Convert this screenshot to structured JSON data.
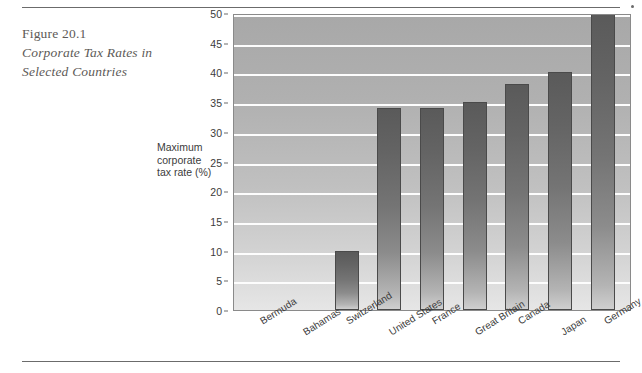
{
  "figure": {
    "number": "Figure 20.1",
    "title_line1": "Corporate Tax Rates in",
    "title_line2": "Selected Countries"
  },
  "axis": {
    "y_label_line1": "Maximum",
    "y_label_line2": "corporate",
    "y_label_line3": "tax rate (%)",
    "y_ticks": [
      "50",
      "45",
      "40",
      "35",
      "30",
      "25",
      "20",
      "15",
      "10",
      "5",
      "0"
    ]
  },
  "chart_data": {
    "type": "bar",
    "title": "Corporate Tax Rates in Selected Countries",
    "xlabel": "",
    "ylabel": "Maximum corporate tax rate (%)",
    "ylim": [
      0,
      50
    ],
    "ytick_step": 5,
    "grid": true,
    "legend": null,
    "categories": [
      "Bermuda",
      "Bahamas",
      "Switzerland",
      "United States",
      "France",
      "Great Britain",
      "Canada",
      "Japan",
      "Germany"
    ],
    "values": [
      0,
      0,
      10,
      34,
      34,
      35,
      38,
      40,
      50
    ],
    "colors": {
      "bar_top": "#5a5a5a",
      "bar_bottom": "#cfcfcf",
      "bar_outline": "#4a4a4a",
      "plot_background_top": "#a8a8a8",
      "plot_background_bottom": "#e6e6e6",
      "gridline": "#fdfdfd",
      "text": "#3b3b3b",
      "caption": "#5d5a57"
    }
  }
}
